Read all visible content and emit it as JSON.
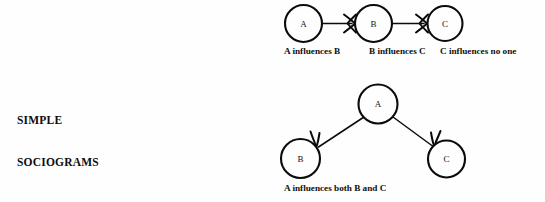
{
  "section": {
    "title_line_1": "SIMPLE",
    "title_line_2": "SOCIOGRAMS"
  },
  "diagram_top": {
    "caption_a": "A influences B",
    "caption_b": "B influences C",
    "caption_c": "C influences no one",
    "nodes": [
      {
        "id": "a",
        "label": "A",
        "cx": 303.5,
        "cy": 23.5,
        "r": 18.5
      },
      {
        "id": "b",
        "label": "B",
        "cx": 373.5,
        "cy": 23.5,
        "r": 18.5
      },
      {
        "id": "c",
        "label": "C",
        "cx": 445.0,
        "cy": 23.5,
        "r": 17.5
      }
    ],
    "edges": [
      {
        "from": "a",
        "to": "b",
        "label": "A influences B"
      },
      {
        "from": "b",
        "to": "c",
        "label": "B influences C"
      }
    ]
  },
  "diagram_bottom": {
    "caption": "A influences both B and C",
    "nodes": [
      {
        "id": "a",
        "label": "A",
        "cx": 378.0,
        "cy": 104.0,
        "r": 19.5
      },
      {
        "id": "b",
        "label": "B",
        "cx": 300.5,
        "cy": 158.5,
        "r": 19.5
      },
      {
        "id": "c",
        "label": "C",
        "cx": 446.5,
        "cy": 159.0,
        "r": 18.5
      }
    ],
    "edges": [
      {
        "from": "a",
        "to": "b"
      },
      {
        "from": "a",
        "to": "c"
      }
    ]
  },
  "colors": {
    "background": "#fefefe",
    "ink": "#0b0b0b",
    "text": "#111111"
  }
}
